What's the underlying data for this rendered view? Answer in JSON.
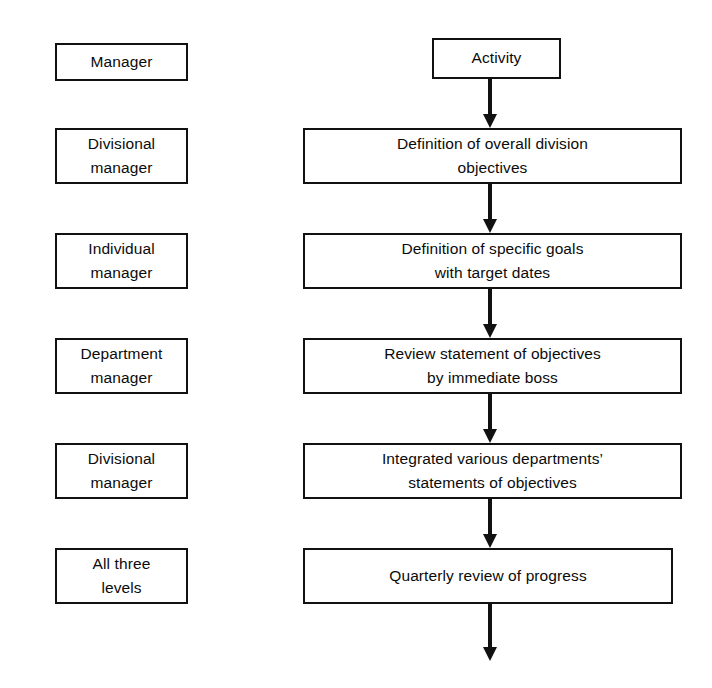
{
  "diagram": {
    "background_color": "#ffffff",
    "line_color": "#111111",
    "text_color": "#0b0b0b",
    "columns": {
      "left_header": "Manager",
      "right_header": "Activity"
    }
  },
  "roles": [
    {
      "lines": [
        "Manager"
      ]
    },
    {
      "lines": [
        "Divisional",
        "manager"
      ]
    },
    {
      "lines": [
        "Individual",
        "manager"
      ]
    },
    {
      "lines": [
        "Department",
        "manager"
      ]
    },
    {
      "lines": [
        "Divisional",
        "manager"
      ]
    },
    {
      "lines": [
        "All three",
        "levels"
      ]
    }
  ],
  "activities": [
    {
      "lines": [
        "Activity"
      ]
    },
    {
      "lines": [
        "Definition of overall division",
        "objectives"
      ]
    },
    {
      "lines": [
        "Definition of specific goals",
        "with target dates"
      ]
    },
    {
      "lines": [
        "Review statement of objectives",
        "by immediate boss"
      ]
    },
    {
      "lines": [
        "Integrated various departments’",
        "statements of objectives"
      ]
    },
    {
      "lines": [
        "Quarterly review of progress"
      ]
    }
  ],
  "connectors": [
    {
      "name": "arrow-activity-to-step1"
    },
    {
      "name": "arrow-step1-to-step2"
    },
    {
      "name": "arrow-step2-to-step3"
    },
    {
      "name": "arrow-step3-to-step4"
    },
    {
      "name": "arrow-step4-to-step5"
    },
    {
      "name": "arrow-step5-outgoing"
    }
  ]
}
